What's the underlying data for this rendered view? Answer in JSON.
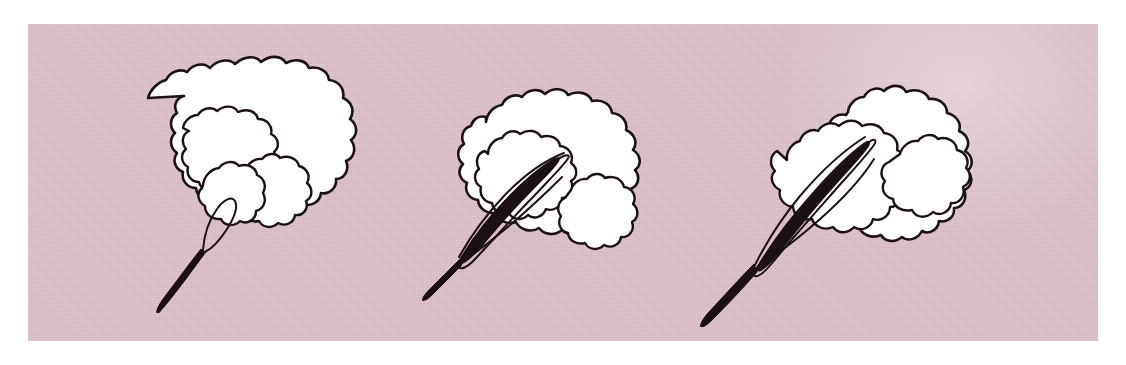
{
  "figure": {
    "panel_count": 3,
    "background_color": "#d6b4c1",
    "ink_color": "#1b1013",
    "blade_color": "#ffffff",
    "medium": "pen-and-ink line drawing on tinted textured paper",
    "caption": "",
    "labels": []
  },
  "plate": {
    "x": 28,
    "y": 24,
    "width": 1070,
    "height": 317,
    "border": "none",
    "texture": "woven-paper"
  },
  "panels": [
    {
      "index": 1,
      "name": "stage-1",
      "label": "",
      "description": "Youngest stage: blade still tightly rolled; a small closed teardrop loop marks the furled midrib, three nested scalloped lamina outlines, slender straight petiole",
      "vein_visible": false,
      "loop_visible": true,
      "nested_outlines": 3,
      "centroid_x": 225,
      "centroid_y": 170
    },
    {
      "index": 2,
      "name": "stage-2",
      "label": "",
      "description": "Intermediate stage: midrib now a dark lens-shaped spindle, blade half unfolded with two large scalloped lobes and a fine secondary outline",
      "vein_visible": true,
      "loop_visible": false,
      "nested_outlines": 3,
      "centroid_x": 555,
      "centroid_y": 178
    },
    {
      "index": 3,
      "name": "stage-3",
      "label": "",
      "description": "Most expanded stage: broad rounded blade, long dark midrib spindle reaching the apex, outline fully scalloped, petiole longer",
      "vein_visible": true,
      "loop_visible": false,
      "nested_outlines": 3,
      "centroid_x": 900,
      "centroid_y": 175
    }
  ]
}
